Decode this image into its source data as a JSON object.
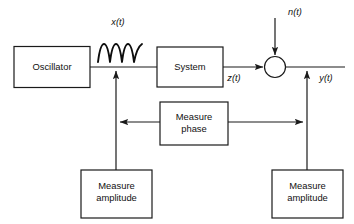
{
  "diagram": {
    "background_color": "#ffffff",
    "line_color": "#1a1a1a",
    "blocks": [
      {
        "id": "oscillator",
        "label": "Oscillator",
        "label_line1": "Oscillator",
        "label_line2": ""
      },
      {
        "id": "system",
        "label": "System",
        "label_line1": "System",
        "label_line2": ""
      },
      {
        "id": "measure-phase",
        "label": "Measure phase",
        "label_line1": "Measure",
        "label_line2": "phase"
      },
      {
        "id": "measure-amplitude-left",
        "label": "Measure amplitude",
        "label_line1": "Measure",
        "label_line2": "amplitude"
      },
      {
        "id": "measure-amplitude-right",
        "label": "Measure amplitude",
        "label_line1": "Measure",
        "label_line2": "amplitude"
      }
    ],
    "signals": [
      {
        "id": "x-of-t",
        "label": "x(t)"
      },
      {
        "id": "z-of-t",
        "label": "z(t)"
      },
      {
        "id": "n-of-t",
        "label": "n(t)"
      },
      {
        "id": "y-of-t",
        "label": "y(t)"
      }
    ],
    "nodes": [
      {
        "id": "summing-junction",
        "shape": "circle",
        "label": ""
      }
    ]
  }
}
